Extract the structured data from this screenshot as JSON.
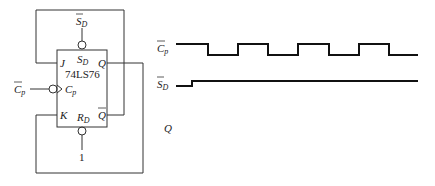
{
  "circuit": {
    "chip_label": "74LS76",
    "pins": {
      "j": "J",
      "k": "K",
      "q": "Q",
      "qbar": "Q",
      "sd": "S",
      "sd_sub": "D",
      "rd": "R",
      "rd_sub": "D",
      "cp": "C",
      "cp_sub": "p"
    },
    "inputs": {
      "sd_bar": "S",
      "sd_bar_sub": "D",
      "cp_bar": "C",
      "cp_bar_sub": "p",
      "rd_value": "1"
    }
  },
  "timing": {
    "signals": [
      {
        "name": "C",
        "sub": "p",
        "overbar": true
      },
      {
        "name": "S",
        "sub": "D",
        "overbar": true
      },
      {
        "name": "Q",
        "sub": "",
        "overbar": false
      }
    ],
    "cp_bar_levels": [
      1,
      0,
      1,
      0,
      1,
      0,
      1,
      0
    ],
    "sd_bar_levels": [
      0,
      1
    ]
  }
}
